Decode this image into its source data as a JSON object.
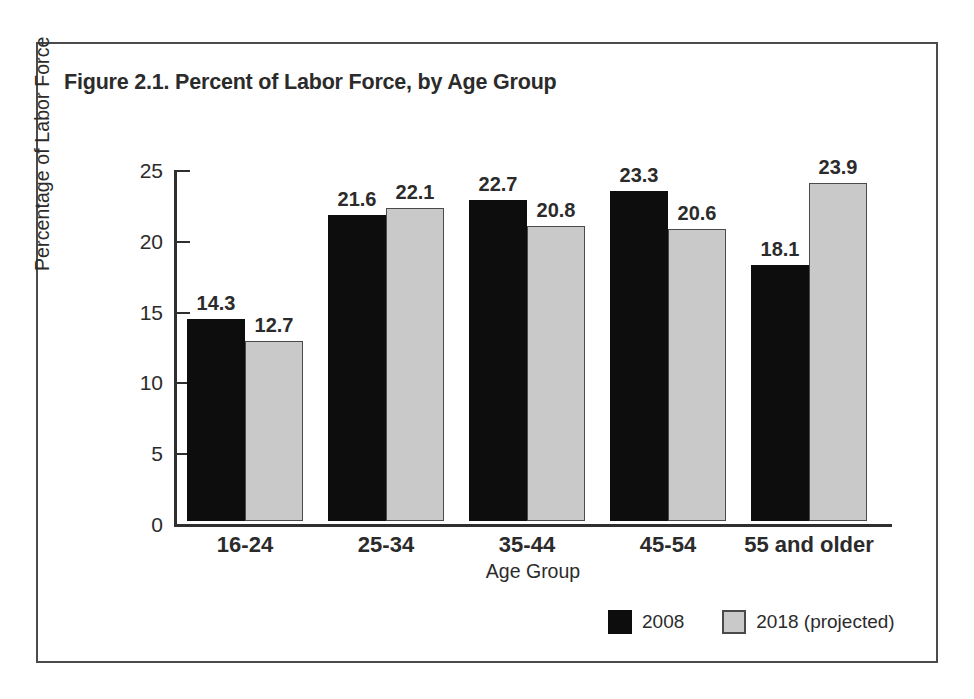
{
  "chart_data": {
    "type": "bar",
    "title": "Figure 2.1. Percent of Labor Force, by Age Group",
    "xlabel": "Age Group",
    "ylabel": "Percentage of Labor Force",
    "ylim": [
      0,
      25
    ],
    "yticks": [
      0,
      5,
      10,
      15,
      20,
      25
    ],
    "ytick_labels": [
      "0",
      "5",
      "10",
      "15",
      "20",
      "25"
    ],
    "grid": false,
    "legend_position": "bottom-right",
    "categories": [
      "16-24",
      "25-34",
      "35-44",
      "45-54",
      "55 and older"
    ],
    "series": [
      {
        "name": "2008",
        "color": "#0d0d0d",
        "values": [
          14.3,
          21.6,
          22.7,
          23.3,
          18.1
        ],
        "labels": [
          "14.3",
          "21.6",
          "22.7",
          "23.3",
          "18.1"
        ]
      },
      {
        "name": "2018 (projected)",
        "color": "#c9c9c9",
        "values": [
          12.7,
          22.1,
          20.8,
          20.6,
          23.9
        ],
        "labels": [
          "12.7",
          "22.1",
          "20.8",
          "20.6",
          "23.9"
        ]
      }
    ]
  },
  "colors": {
    "series_2008": "#0d0d0d",
    "series_2018": "#c9c9c9",
    "series_2018_border": "#4a4a4a",
    "axis": "#2f2f2f",
    "frame": "#4b4b4b",
    "text": "#2b2b2b",
    "background": "#ffffff"
  }
}
